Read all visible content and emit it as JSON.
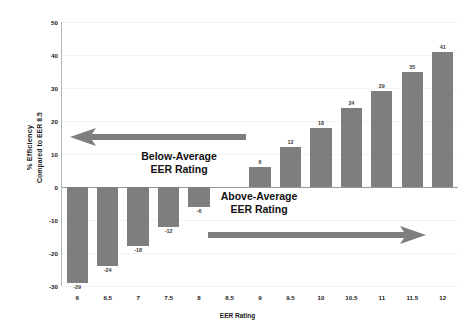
{
  "chart_data": {
    "type": "bar",
    "title": "",
    "xlabel": "EER Rating",
    "ylabel_line1": "% Efficiency",
    "ylabel_line2": "Compared to EER 8.5",
    "categories": [
      "6",
      "6.5",
      "7",
      "7.5",
      "8",
      "8.5",
      "9",
      "9.5",
      "10",
      "10.5",
      "11",
      "11.5",
      "12"
    ],
    "values": [
      -29,
      -24,
      -18,
      -12,
      -6,
      0,
      6,
      12,
      18,
      24,
      29,
      35,
      41
    ],
    "bar_labels": [
      "-29",
      "-24",
      "-18",
      "-12",
      "-6",
      "",
      "6",
      "12",
      "18",
      "24",
      "29",
      "35",
      "41"
    ],
    "ylim": [
      -30,
      50
    ],
    "yticks": [
      50,
      40,
      30,
      20,
      10,
      0,
      -10,
      -20,
      -30
    ],
    "ytick_labels": [
      "50",
      "40",
      "30",
      "20",
      "10",
      "0",
      "-10",
      "-20",
      "-30"
    ],
    "grid": true,
    "legend": "none",
    "bar_color": "#7e7e7e",
    "annotations": [
      {
        "name": "below-average",
        "line1": "Below-Average",
        "line2": "EER Rating",
        "arrow_direction": "left",
        "arrow_color": "#7e7e7e"
      },
      {
        "name": "above-average",
        "line1": "Above-Average",
        "line2": "EER Rating",
        "arrow_direction": "right",
        "arrow_color": "#7e7e7e"
      }
    ]
  }
}
